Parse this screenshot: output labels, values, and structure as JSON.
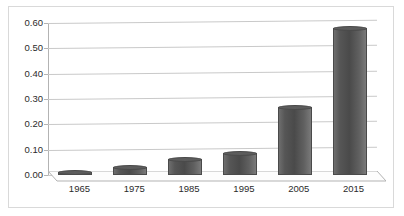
{
  "chart_data": {
    "type": "bar",
    "title": "",
    "subtitle": "",
    "xlabel": "",
    "ylabel": "",
    "categories": [
      "1965",
      "1975",
      "1985",
      "1995",
      "2005",
      "2015"
    ],
    "values": [
      0.012,
      0.03,
      0.065,
      0.085,
      0.27,
      0.58
    ],
    "series": [
      {
        "name": "Series 1",
        "values": [
          0.012,
          0.03,
          0.065,
          0.085,
          0.27,
          0.58
        ]
      }
    ],
    "ylim": [
      0.0,
      0.6
    ],
    "ytick_labels": [
      "0.00",
      "0.10",
      "0.20",
      "0.30",
      "0.40",
      "0.50",
      "0.60"
    ],
    "ytick_values": [
      0.0,
      0.1,
      0.2,
      0.3,
      0.4,
      0.5,
      0.6
    ],
    "grid": true,
    "legend": false,
    "legend_position": "none",
    "annotations": [],
    "colors": {
      "bar_fill": "#565656",
      "bar_edge": "#4a4a4a",
      "gridline": "#c9c9c9",
      "axis": "#b3b3b3",
      "frame_border": "#d9d9d9",
      "text": "#2b2b2b",
      "background": "#ffffff"
    }
  }
}
